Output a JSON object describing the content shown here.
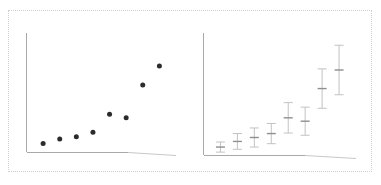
{
  "figure": {
    "title": "",
    "frame": {
      "style": "dotted",
      "color": "#cfcfcf"
    },
    "background_color": "#ffffff",
    "panel_count": 2
  },
  "chart_data": [
    {
      "panel_name": "left-scatter-panel",
      "type": "scatter",
      "title": "",
      "xlabel": "",
      "ylabel": "",
      "xlim": [
        0,
        9
      ],
      "ylim": [
        0,
        10
      ],
      "grid": false,
      "legend": "none",
      "axes": {
        "left_spine": true,
        "bottom_spine": true,
        "top_spine": false,
        "right_spine": false
      },
      "marker": {
        "shape": "circle",
        "color": "#2b2b2b",
        "size_px": 5
      },
      "x": [
        1,
        2,
        3,
        4,
        5,
        6,
        7,
        8
      ],
      "y": [
        0.8,
        1.2,
        1.4,
        1.8,
        3.4,
        3.1,
        6.0,
        7.7
      ],
      "series": [
        {
          "name": "observations",
          "values": [
            0.8,
            1.2,
            1.4,
            1.8,
            3.4,
            3.1,
            6.0,
            7.7
          ]
        }
      ]
    },
    {
      "panel_name": "right-errorbar-panel",
      "type": "scatter",
      "subtype": "errorbar",
      "title": "",
      "xlabel": "",
      "ylabel": "",
      "xlim": [
        0,
        9
      ],
      "ylim": [
        0,
        10
      ],
      "grid": false,
      "legend": "none",
      "axes": {
        "left_spine": true,
        "bottom_spine": true,
        "top_spine": false,
        "right_spine": false
      },
      "marker": {
        "shape": "tick",
        "color": "#8f8f8f"
      },
      "errorbar_color": "#c2c2c2",
      "x": [
        1,
        2,
        3,
        4,
        5,
        6,
        7,
        8
      ],
      "y": [
        0.75,
        1.25,
        1.6,
        1.95,
        3.35,
        3.05,
        5.95,
        7.6
      ],
      "yerr_low": [
        0.45,
        0.7,
        0.85,
        0.9,
        1.35,
        1.25,
        1.75,
        2.2
      ],
      "yerr_high": [
        0.45,
        0.7,
        0.85,
        0.9,
        1.35,
        1.25,
        1.75,
        2.2
      ],
      "series": [
        {
          "name": "estimates with uncertainty",
          "values": [
            0.75,
            1.25,
            1.6,
            1.95,
            3.35,
            3.05,
            5.95,
            7.6
          ]
        }
      ]
    }
  ]
}
